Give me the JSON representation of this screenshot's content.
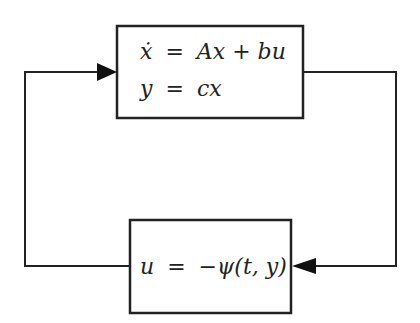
{
  "diagram": {
    "type": "feedback-loop-block-diagram",
    "plant_block": {
      "line1": {
        "lhs": "ẋ",
        "eq": "=",
        "rhs": "Ax + bu"
      },
      "line2": {
        "lhs": "y",
        "eq": "=",
        "rhs": "cx"
      }
    },
    "feedback_block": {
      "line1": {
        "lhs": "u",
        "eq": "=",
        "rhs": "−ψ(t, y)"
      }
    },
    "edges": [
      {
        "from": "plant_block",
        "to": "feedback_block",
        "label": ""
      },
      {
        "from": "feedback_block",
        "to": "plant_block",
        "label": ""
      }
    ],
    "colors": {
      "line": "#222222",
      "background": "#ffffff"
    }
  }
}
